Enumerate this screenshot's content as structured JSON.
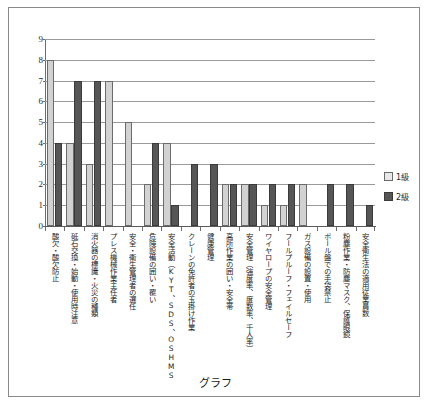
{
  "caption": "グラフ",
  "legend": {
    "position": "right",
    "entries": [
      {
        "label": "1級",
        "color": "#e8e8e8",
        "icon": "legend-swatch-light"
      },
      {
        "label": "2級",
        "color": "#565656",
        "icon": "legend-swatch-dark"
      }
    ]
  },
  "axis": {
    "y_ticks": [
      "9",
      "8",
      "7",
      "6",
      "5",
      "4",
      "3",
      "2",
      "1",
      "0"
    ]
  },
  "chart_data": {
    "type": "bar",
    "title": "",
    "xlabel": "",
    "ylabel": "",
    "ylim": [
      0,
      9
    ],
    "grid": true,
    "legend_position": "right",
    "categories": [
      "酸欠・酸欠防止",
      "砥石交換・始動・使用時注意",
      "消火器の標識・火災の種類",
      "プレス機械作業主任者",
      "安全・衛生管理者の選任",
      "危険設備の囲い・覆い",
      "安全活動（KYT、SDS、OSHMS",
      "クレーンの免許者の玉掛け作業",
      "健康管理",
      "高所作業の囲い・安全帯",
      "安全管理（強度率、度数率、千人率）",
      "ワイヤロープの安全管理",
      "フールプルーフ・フェイルセーフ",
      "ガス設備の設置・使用",
      "ボール盤での手袋禁止",
      "粉塵作業・防塵マスク、保護眼鏡",
      "安全衛生法の適用従業員数"
    ],
    "series": [
      {
        "name": "1級",
        "color": "#d2d2d2",
        "values": [
          8,
          4,
          3,
          7,
          5,
          2,
          4,
          0,
          0,
          2,
          2,
          1,
          1,
          2,
          0,
          0,
          0
        ]
      },
      {
        "name": "2級",
        "color": "#565656",
        "values": [
          4,
          7,
          7,
          0,
          0,
          4,
          1,
          3,
          3,
          2,
          2,
          2,
          2,
          0,
          2,
          2,
          1
        ]
      }
    ]
  }
}
